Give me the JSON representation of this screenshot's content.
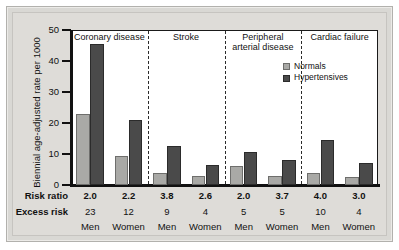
{
  "chart_data": {
    "type": "bar",
    "title": "",
    "xlabel": "",
    "ylabel": "Biennial age-adjusted rate per 1000",
    "ylim": [
      0,
      50
    ],
    "yticks": [
      0,
      10,
      20,
      30,
      40,
      50
    ],
    "grid": false,
    "legend_position": "top-right",
    "legend": [
      "Normals",
      "Hypertensives"
    ],
    "panels": [
      "Coronary disease",
      "Stroke",
      "Peripheral\narterial disease",
      "Cardiac failure"
    ],
    "categories": [
      "Men",
      "Women",
      "Men",
      "Women",
      "Men",
      "Women",
      "Men",
      "Women"
    ],
    "series": [
      {
        "name": "Normals",
        "color": "#a9a9a6",
        "values": [
          23,
          9.5,
          4,
          3,
          6,
          3,
          4,
          2.5
        ]
      },
      {
        "name": "Hypertensives",
        "color": "#4a4a4a",
        "values": [
          45.5,
          21,
          12.5,
          6.5,
          10.5,
          8,
          14.5,
          7
        ]
      }
    ],
    "risk_ratio": [
      "2.0",
      "2.2",
      "3.8",
      "2.6",
      "2.0",
      "3.7",
      "4.0",
      "3.0"
    ],
    "excess_risk": [
      "23",
      "12",
      "9",
      "4",
      "5",
      "5",
      "10",
      "4"
    ]
  },
  "axis": {
    "y_title": "Biennial age-adjusted rate per 1000",
    "y_ticks": [
      "50",
      "40",
      "30",
      "20",
      "10",
      "0"
    ]
  },
  "panels": [
    {
      "title": "Coronary disease"
    },
    {
      "title": "Stroke"
    },
    {
      "title": "Peripheral\narterial disease"
    },
    {
      "title": "Cardiac failure"
    }
  ],
  "legend": {
    "normals_label": "Normals",
    "hypertensives_label": "Hypertensives"
  },
  "table": {
    "risk_ratio_label": "Risk ratio",
    "excess_risk_label": "Excess risk",
    "risk_ratio": [
      "2.0",
      "2.2",
      "3.8",
      "2.6",
      "2.0",
      "3.7",
      "4.0",
      "3.0"
    ],
    "excess_risk": [
      "23",
      "12",
      "9",
      "4",
      "5",
      "5",
      "10",
      "4"
    ],
    "sex": [
      "Men",
      "Women",
      "Men",
      "Women",
      "Men",
      "Women",
      "Men",
      "Women"
    ]
  }
}
